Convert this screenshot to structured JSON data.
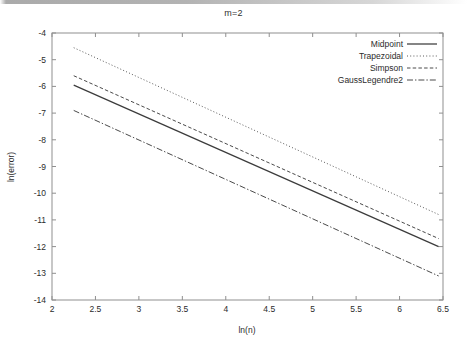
{
  "chart_data": {
    "type": "line",
    "title": "m=2",
    "xlabel": "ln(n)",
    "ylabel": "ln(error)",
    "xlim": [
      2,
      6.5
    ],
    "ylim": [
      -14,
      -4
    ],
    "xticks": [
      "2",
      "2.5",
      "3",
      "3.5",
      "4",
      "4.5",
      "5",
      "5.5",
      "6",
      "6.5"
    ],
    "xtick_values": [
      2,
      2.5,
      3,
      3.5,
      4,
      4.5,
      5,
      5.5,
      6,
      6.5
    ],
    "yticks": [
      "-4",
      "-5",
      "-6",
      "-7",
      "-8",
      "-9",
      "-10",
      "-11",
      "-12",
      "-13",
      "-14"
    ],
    "ytick_values": [
      -4,
      -5,
      -6,
      -7,
      -8,
      -9,
      -10,
      -11,
      -12,
      -13,
      -14
    ],
    "grid": false,
    "legend_position": "top-right",
    "x": [
      2.25,
      6.45
    ],
    "series": [
      {
        "name": "Midpoint",
        "style": "solid",
        "color": "#3c3c3c",
        "values": [
          -5.95,
          -12.0
        ]
      },
      {
        "name": "Trapezoidal",
        "style": "dotted",
        "color": "#5a5a5a",
        "values": [
          -4.55,
          -10.8
        ]
      },
      {
        "name": "Simpson",
        "style": "dashed",
        "color": "#4a4a4a",
        "values": [
          -5.6,
          -11.7
        ]
      },
      {
        "name": "GaussLegendre2",
        "style": "dashdot",
        "color": "#4a4a4a",
        "values": [
          -6.9,
          -13.1
        ]
      }
    ]
  },
  "axis": {
    "frame_color": "#8f8f8f"
  }
}
